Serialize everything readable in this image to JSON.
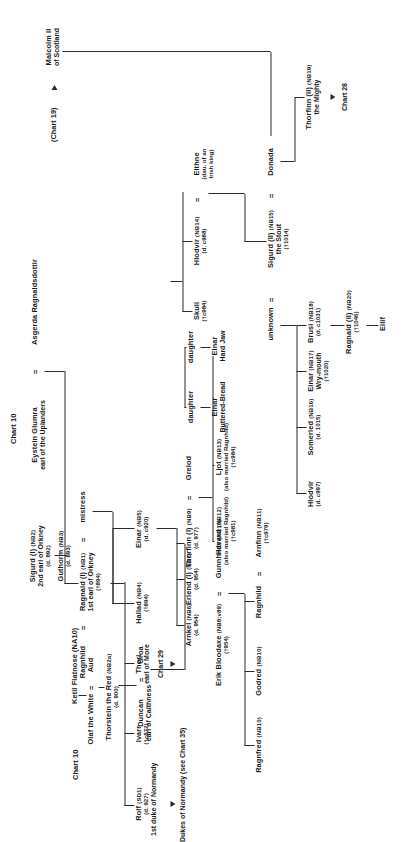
{
  "chart": {
    "title": "Chart 10",
    "top_refs": {
      "ketil": "Ketil Flatnose (NA10)",
      "chart10_left": "Chart 10",
      "chart19": "(Chart 19)",
      "chart28": "Chart 28",
      "chart29": "Chart 29",
      "chart35": "Dukes of Normandy (see Chart 35)"
    },
    "people": [
      {
        "id": "eystein",
        "name": "Eystein Glumra",
        "title": "earl of the Uplanders"
      },
      {
        "id": "asgerda",
        "name": "Asgerda Ragnaldsdottir"
      },
      {
        "id": "ragnhild0",
        "name": "Ragnhild"
      },
      {
        "id": "ragnald1",
        "name": "Ragnald (I)",
        "code": "(NB1)",
        "title": "1st earl of Orkney",
        "dates": "(†894)"
      },
      {
        "id": "mistress",
        "name": "mistress"
      },
      {
        "id": "rolf",
        "name": "Rolf",
        "code": "(SD1)",
        "dates": "(d. 927)",
        "title": "1st duke of Normandy"
      },
      {
        "id": "ivarr",
        "name": "Ivarr",
        "dates": "(†c872)"
      },
      {
        "id": "thori",
        "name": "Thori",
        "title": "earl of More"
      },
      {
        "id": "hallad",
        "name": "Hallad",
        "code": "(NB4)",
        "dates": "(†894)"
      },
      {
        "id": "einar5",
        "name": "Einar",
        "code": "(NB5)",
        "dates": "(d. c920)"
      },
      {
        "id": "sigurd1",
        "name": "Sigurd (I)",
        "code": "(NB2)",
        "title": "2nd earl of Orkney",
        "dates": "(d. 892)"
      },
      {
        "id": "guthorm",
        "name": "Guthorm",
        "code": "(NB3)",
        "dates": "(d. 893)"
      },
      {
        "id": "olaf",
        "name": "Olaf the White"
      },
      {
        "id": "aud",
        "name": "Aud"
      },
      {
        "id": "thorstein",
        "name": "Thorstein the Red",
        "code": "(NB2a)",
        "dates": "(d. 900)"
      },
      {
        "id": "duncan",
        "name": "Duncan",
        "title": "earl of Caithness"
      },
      {
        "id": "groa",
        "name": "Groa"
      },
      {
        "id": "erik",
        "name": "Erik Bloodaxe",
        "code": "(NB8;v89)",
        "dates": "(†954)"
      },
      {
        "id": "gunnhildr",
        "name": "Gunnhildr",
        "code": "(NB10)"
      },
      {
        "id": "ragnfred",
        "name": "Ragnfred",
        "code": "(NB10)"
      },
      {
        "id": "godred",
        "name": "Godred",
        "code": "(NB10)"
      },
      {
        "id": "ragnhild2",
        "name": "Ragnhild"
      },
      {
        "id": "arnfinn",
        "name": "Arnfinn",
        "code": "(NB11)",
        "dates": "(†c979)"
      },
      {
        "id": "arnkel",
        "name": "Arnkel",
        "code": "(NB6)",
        "dates": "(d. 954)"
      },
      {
        "id": "erlend1",
        "name": "Erlend (I)",
        "code": "(NB7)",
        "dates": "(d. 954)"
      },
      {
        "id": "thorfinn1",
        "name": "Thorfinn (I)",
        "code": "(NB9)",
        "dates": "(d. 977)"
      },
      {
        "id": "grelod",
        "name": "Grelod"
      },
      {
        "id": "havard",
        "name": "Havard",
        "code": "(NB12)",
        "note": "(also married Ragnhild)",
        "dates": "(†c981)"
      },
      {
        "id": "ljot",
        "name": "Ljot",
        "code": "(NB13)",
        "note": "(also married Ragnhild)",
        "dates": "(†c984)"
      },
      {
        "id": "dau1",
        "name": "daughter"
      },
      {
        "id": "einarbb",
        "name": "Einar",
        "title": "Buttered-Bread"
      },
      {
        "id": "dau2",
        "name": "daughter"
      },
      {
        "id": "einarhj",
        "name": "Einar",
        "title": "Hard Jaw"
      },
      {
        "id": "skuli",
        "name": "Skuli",
        "dates": "(†c984)"
      },
      {
        "id": "hlodvir14",
        "name": "Hlodvir",
        "code": "(NB14)",
        "dates": "(d. c988)"
      },
      {
        "id": "eithne",
        "name": "Eithne",
        "note": "(dau. of an",
        "note2": "Irish king)"
      },
      {
        "id": "malcolm",
        "name": "Malcolm II",
        "title": "of Scotland"
      },
      {
        "id": "sigurd2",
        "name": "Sigurd (II)",
        "code": "(NB15)",
        "title": "the Stout",
        "dates": "(†1014)"
      },
      {
        "id": "unknown",
        "name": "unknown"
      },
      {
        "id": "donada",
        "name": "Donada"
      },
      {
        "id": "hlodvir97",
        "name": "Hlodvir",
        "dates": "(d. c997)"
      },
      {
        "id": "somerled",
        "name": "Somerled",
        "code": "(NB16)",
        "dates": "(d. 1015)"
      },
      {
        "id": "einarwm",
        "name": "Einar",
        "code": "(NB17)",
        "title": "Wry-mouth",
        "dates": "(†1020)"
      },
      {
        "id": "brusi",
        "name": "Brusi",
        "code": "(NB18)",
        "dates": "(d. c1031)"
      },
      {
        "id": "ragnald2",
        "name": "Ragnald (II)",
        "code": "(NB20)",
        "dates": "(†1046)"
      },
      {
        "id": "eilif",
        "name": "Eilif"
      },
      {
        "id": "thorfinn2",
        "name": "Thorfinn (II)",
        "code": "(NB19)",
        "title": "the Mighty"
      }
    ],
    "equals_signs": "=",
    "colors": {
      "line": "#2b2b2b",
      "text": "#1a1a1a",
      "background": "#ffffff"
    }
  }
}
